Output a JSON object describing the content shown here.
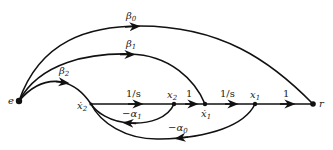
{
  "diagram": {
    "type": "signal-flow-graph",
    "nodes": [
      {
        "id": "e",
        "label": "e"
      },
      {
        "id": "x2dot",
        "label": "ẋ",
        "sub": "2"
      },
      {
        "id": "x2",
        "label": "x",
        "sub": "2"
      },
      {
        "id": "x1dot",
        "label": "ẋ",
        "sub": "1"
      },
      {
        "id": "x1",
        "label": "x",
        "sub": "1"
      },
      {
        "id": "r",
        "label": "r"
      }
    ],
    "edges": [
      {
        "from": "e",
        "to": "r",
        "gain": "β",
        "sub": "0"
      },
      {
        "from": "e",
        "to": "x1dot",
        "gain": "β",
        "sub": "1"
      },
      {
        "from": "e",
        "to": "x2dot",
        "gain": "β",
        "sub": "2"
      },
      {
        "from": "x2dot",
        "to": "x2",
        "gain": "1/s"
      },
      {
        "from": "x2",
        "to": "x1dot",
        "gain": "1"
      },
      {
        "from": "x1dot",
        "to": "x1",
        "gain": "1/s"
      },
      {
        "from": "x1",
        "to": "r",
        "gain": "1"
      },
      {
        "from": "x2",
        "to": "x2dot",
        "gain": "−α",
        "sub": "1"
      },
      {
        "from": "x1",
        "to": "x2dot",
        "gain": "−α",
        "sub": "0"
      }
    ]
  }
}
